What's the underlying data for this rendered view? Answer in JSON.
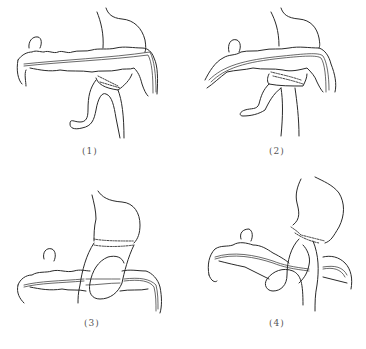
{
  "figure": {
    "panels": [
      {
        "id": 1,
        "label": "(1)"
      },
      {
        "id": 2,
        "label": "(2)"
      },
      {
        "id": 3,
        "label": "(3)"
      },
      {
        "id": 4,
        "label": "(4)"
      }
    ]
  }
}
